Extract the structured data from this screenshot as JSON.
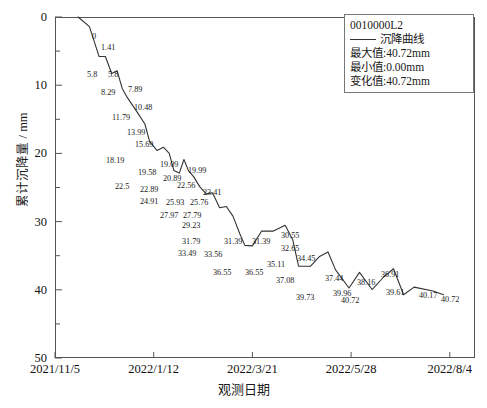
{
  "legend": {
    "id_label": "0010000L2",
    "series_name": "沉降曲线",
    "max_label": "最大值:40.72mm",
    "min_label": "最小值:0.00mm",
    "change_label": "变化值:40.72mm"
  },
  "axes": {
    "ylabel": "累计沉降量 / mm",
    "xlabel": "观测日期",
    "ytick_labels": [
      "0",
      "10",
      "20",
      "30",
      "40",
      "50"
    ],
    "xtick_labels": [
      "2021/11/5",
      "2022/1/12",
      "2022/3/21",
      "2022/5/28",
      "2022/8/4"
    ]
  },
  "colors": {
    "line": "#333333",
    "frame": "#555555",
    "text": "#1a1a1a"
  },
  "chart_data": {
    "type": "line",
    "title": "0010000L2",
    "xlabel": "观测日期",
    "ylabel": "累计沉降量 / mm",
    "ylim": [
      50,
      0
    ],
    "y_inverted": true,
    "yticks": [
      0,
      10,
      20,
      30,
      40,
      50
    ],
    "y_minor_tick_step": 5,
    "xlim": [
      "2021/11/5",
      "2022/9/20"
    ],
    "xticks": [
      "2021/11/5",
      "2022/1/12",
      "2022/3/21",
      "2022/5/28",
      "2022/8/4"
    ],
    "grid": false,
    "legend_position": "top-right",
    "series": [
      {
        "name": "沉降曲线",
        "labels": [
          "0",
          "1.41",
          "5.8",
          "5.8",
          "8.29",
          "7.89",
          "10.48",
          "11.79",
          "13.99",
          "15.69",
          "18.19",
          "19.58",
          "19.09",
          "19.99",
          "22.5",
          "22.89",
          "20.89",
          "22.56",
          "23.41",
          "24.91",
          "25.93",
          "25.76",
          "27.97",
          "27.79",
          "29.23",
          "31.79",
          "33.49",
          "33.56",
          "31.39",
          "31.39",
          "30.55",
          "32.65",
          "36.55",
          "36.55",
          "35.11",
          "34.45",
          "37.08",
          "39.73",
          "37.44",
          "39.96",
          "38.16",
          "36.91",
          "40.72",
          "39.61",
          "40.17",
          "40.72"
        ],
        "values": [
          0,
          1.41,
          5.8,
          5.8,
          8.29,
          7.89,
          10.48,
          11.79,
          13.99,
          15.69,
          18.19,
          19.58,
          19.09,
          19.99,
          22.5,
          22.89,
          20.89,
          22.56,
          23.41,
          24.91,
          25.93,
          25.76,
          27.97,
          27.79,
          29.23,
          31.79,
          33.49,
          33.56,
          31.39,
          31.39,
          30.55,
          32.65,
          36.55,
          36.55,
          35.11,
          34.45,
          37.08,
          39.73,
          37.44,
          39.96,
          38.16,
          36.91,
          40.72,
          39.61,
          40.17,
          40.72
        ],
        "x_positions": [
          0.055,
          0.082,
          0.105,
          0.12,
          0.135,
          0.148,
          0.16,
          0.172,
          0.196,
          0.214,
          0.225,
          0.243,
          0.258,
          0.272,
          0.283,
          0.296,
          0.307,
          0.318,
          0.33,
          0.345,
          0.36,
          0.375,
          0.392,
          0.408,
          0.424,
          0.44,
          0.452,
          0.47,
          0.492,
          0.52,
          0.548,
          0.566,
          0.58,
          0.608,
          0.63,
          0.65,
          0.668,
          0.7,
          0.725,
          0.755,
          0.782,
          0.806,
          0.83,
          0.855,
          0.9,
          0.925
        ],
        "max_value": 40.72,
        "min_value": 0.0,
        "change_value": 40.72
      }
    ]
  },
  "point_labels": [
    {
      "text": "0",
      "x": 92,
      "y": 33
    },
    {
      "text": "1.41",
      "x": 101,
      "y": 44
    },
    {
      "text": "5.8",
      "x": 87,
      "y": 71
    },
    {
      "text": "5.8",
      "x": 108,
      "y": 71
    },
    {
      "text": "8.29",
      "x": 101,
      "y": 89
    },
    {
      "text": "7.89",
      "x": 128,
      "y": 86
    },
    {
      "text": "10.48",
      "x": 134,
      "y": 104
    },
    {
      "text": "11.79",
      "x": 112,
      "y": 114
    },
    {
      "text": "13.99",
      "x": 127,
      "y": 129
    },
    {
      "text": "15.69",
      "x": 135,
      "y": 141
    },
    {
      "text": "18.19",
      "x": 106,
      "y": 157
    },
    {
      "text": "19.58",
      "x": 138,
      "y": 169
    },
    {
      "text": "19.09",
      "x": 160,
      "y": 161
    },
    {
      "text": "19.99",
      "x": 188,
      "y": 167
    },
    {
      "text": "22.5",
      "x": 115,
      "y": 183
    },
    {
      "text": "22.89",
      "x": 140,
      "y": 186
    },
    {
      "text": "20.89",
      "x": 163,
      "y": 175
    },
    {
      "text": "22.56",
      "x": 177,
      "y": 182
    },
    {
      "text": "23.41",
      "x": 203,
      "y": 189
    },
    {
      "text": "24.91",
      "x": 140,
      "y": 198
    },
    {
      "text": "25.93",
      "x": 166,
      "y": 199
    },
    {
      "text": "25.76",
      "x": 190,
      "y": 199
    },
    {
      "text": "27.97",
      "x": 160,
      "y": 212
    },
    {
      "text": "27.79",
      "x": 183,
      "y": 212
    },
    {
      "text": "29.23",
      "x": 182,
      "y": 222
    },
    {
      "text": "31.79",
      "x": 182,
      "y": 238
    },
    {
      "text": "33.49",
      "x": 178,
      "y": 250
    },
    {
      "text": "33.56",
      "x": 204,
      "y": 251
    },
    {
      "text": "31.39",
      "x": 224,
      "y": 238
    },
    {
      "text": "31.39",
      "x": 252,
      "y": 238
    },
    {
      "text": "30.55",
      "x": 281,
      "y": 232
    },
    {
      "text": "32.65",
      "x": 281,
      "y": 245
    },
    {
      "text": "36.55",
      "x": 213,
      "y": 269
    },
    {
      "text": "36.55",
      "x": 245,
      "y": 269
    },
    {
      "text": "35.11",
      "x": 267,
      "y": 261
    },
    {
      "text": "34.45",
      "x": 297,
      "y": 255
    },
    {
      "text": "37.08",
      "x": 276,
      "y": 277
    },
    {
      "text": "39.73",
      "x": 296,
      "y": 294
    },
    {
      "text": "37.44",
      "x": 325,
      "y": 275
    },
    {
      "text": "39.96",
      "x": 333,
      "y": 290
    },
    {
      "text": "38.16",
      "x": 357,
      "y": 279
    },
    {
      "text": "36.91",
      "x": 381,
      "y": 271
    },
    {
      "text": "40.72",
      "x": 341,
      "y": 297
    },
    {
      "text": "39.61",
      "x": 386,
      "y": 289
    },
    {
      "text": "40.17",
      "x": 419,
      "y": 292
    },
    {
      "text": "40.72",
      "x": 441,
      "y": 296
    }
  ]
}
